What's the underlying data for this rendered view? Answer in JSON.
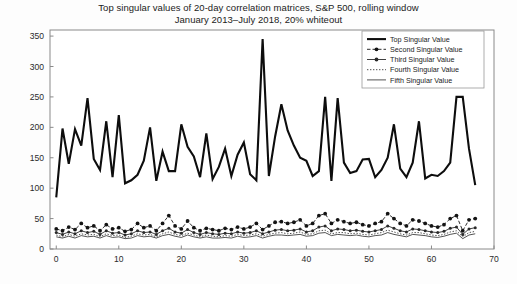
{
  "chart_data": {
    "type": "line",
    "title": "Top singular values of 20-day correlation matrices, S&P 500, rolling window",
    "subtitle": "January 2013–July 2018, 20% whiteout",
    "xlabel": "",
    "ylabel": "",
    "xlim": [
      -1,
      70
    ],
    "ylim": [
      0,
      360
    ],
    "xticks": [
      0,
      10,
      20,
      30,
      40,
      50,
      60,
      70
    ],
    "yticks": [
      0,
      50,
      100,
      150,
      200,
      250,
      300,
      350
    ],
    "grid": false,
    "legend_position": "top-right",
    "x": [
      0,
      1,
      2,
      3,
      4,
      5,
      6,
      7,
      8,
      9,
      10,
      11,
      12,
      13,
      14,
      15,
      16,
      17,
      18,
      19,
      20,
      21,
      22,
      23,
      24,
      25,
      26,
      27,
      28,
      29,
      30,
      31,
      32,
      33,
      34,
      35,
      36,
      37,
      38,
      39,
      40,
      41,
      42,
      43,
      44,
      45,
      46,
      47,
      48,
      49,
      50,
      51,
      52,
      53,
      54,
      55,
      56,
      57,
      58,
      59,
      60,
      61,
      62,
      63,
      64,
      65,
      66,
      67
    ],
    "series": [
      {
        "name": "Top Singular Value",
        "style": "thick-solid",
        "marker": "none",
        "color": "#0d0d0d",
        "values": [
          85,
          198,
          140,
          197,
          170,
          248,
          148,
          130,
          210,
          118,
          220,
          108,
          113,
          122,
          145,
          200,
          112,
          160,
          128,
          128,
          205,
          168,
          152,
          118,
          190,
          115,
          135,
          165,
          120,
          155,
          175,
          123,
          113,
          345,
          120,
          185,
          238,
          195,
          170,
          150,
          145,
          120,
          128,
          250,
          112,
          248,
          142,
          125,
          128,
          147,
          148,
          118,
          130,
          150,
          205,
          132,
          118,
          142,
          210,
          116,
          122,
          120,
          128,
          142,
          250,
          250,
          165,
          105
        ]
      },
      {
        "name": "Second Singular Value",
        "style": "dashed",
        "marker": "dot",
        "color": "#141414",
        "values": [
          33,
          30,
          36,
          32,
          42,
          35,
          38,
          30,
          40,
          33,
          35,
          29,
          32,
          42,
          35,
          38,
          30,
          42,
          55,
          38,
          33,
          46,
          35,
          30,
          34,
          32,
          30,
          34,
          32,
          36,
          33,
          36,
          42,
          32,
          38,
          44,
          45,
          42,
          44,
          48,
          38,
          42,
          55,
          58,
          42,
          48,
          45,
          42,
          44,
          40,
          38,
          42,
          45,
          58,
          50,
          42,
          38,
          48,
          46,
          42,
          38,
          36,
          40,
          50,
          55,
          30,
          48,
          50
        ]
      },
      {
        "name": "Third Singular Value",
        "style": "solid-marker",
        "marker": "dot",
        "color": "#2a2a2a",
        "values": [
          27,
          24,
          28,
          25,
          30,
          27,
          29,
          24,
          30,
          26,
          27,
          23,
          25,
          30,
          27,
          28,
          24,
          30,
          34,
          28,
          26,
          32,
          27,
          24,
          27,
          25,
          24,
          26,
          25,
          28,
          26,
          27,
          30,
          25,
          28,
          31,
          32,
          30,
          31,
          33,
          28,
          30,
          36,
          38,
          30,
          33,
          32,
          30,
          31,
          29,
          28,
          30,
          32,
          38,
          34,
          30,
          28,
          33,
          32,
          30,
          28,
          27,
          29,
          34,
          36,
          24,
          33,
          35
        ]
      },
      {
        "name": "Fourth Singular Value",
        "style": "dotted",
        "marker": "none",
        "color": "#3a3a3a",
        "values": [
          23,
          20,
          24,
          21,
          25,
          23,
          24,
          20,
          25,
          22,
          23,
          19,
          21,
          25,
          23,
          24,
          20,
          25,
          28,
          24,
          22,
          26,
          23,
          20,
          23,
          21,
          20,
          22,
          21,
          24,
          22,
          23,
          25,
          21,
          24,
          26,
          27,
          25,
          26,
          28,
          24,
          25,
          30,
          31,
          25,
          27,
          27,
          25,
          26,
          24,
          23,
          25,
          27,
          31,
          28,
          25,
          23,
          27,
          27,
          25,
          23,
          22,
          24,
          28,
          30,
          20,
          27,
          29
        ]
      },
      {
        "name": "Fifth Singular Value",
        "style": "thin-solid",
        "marker": "none",
        "color": "#1b1b1b",
        "values": [
          20,
          18,
          21,
          18,
          22,
          20,
          21,
          18,
          22,
          19,
          20,
          17,
          18,
          22,
          20,
          21,
          18,
          22,
          24,
          21,
          19,
          23,
          20,
          18,
          20,
          18,
          18,
          19,
          18,
          21,
          19,
          20,
          22,
          18,
          21,
          23,
          23,
          22,
          23,
          24,
          21,
          22,
          26,
          27,
          22,
          24,
          23,
          22,
          23,
          21,
          20,
          22,
          23,
          27,
          24,
          22,
          20,
          24,
          23,
          22,
          20,
          19,
          21,
          24,
          26,
          17,
          23,
          25
        ]
      }
    ]
  },
  "legend": {
    "entries": [
      {
        "label": "Top Singular Value"
      },
      {
        "label": "Second Singular Value"
      },
      {
        "label": "Third Singular Value"
      },
      {
        "label": "Fourth Singular Value"
      },
      {
        "label": "Fifth Singular Value"
      }
    ]
  },
  "axes": {
    "x_tick_labels": [
      "0",
      "10",
      "20",
      "30",
      "40",
      "50",
      "60",
      "70"
    ],
    "y_tick_labels": [
      "0",
      "50",
      "100",
      "150",
      "200",
      "250",
      "300",
      "350"
    ]
  }
}
